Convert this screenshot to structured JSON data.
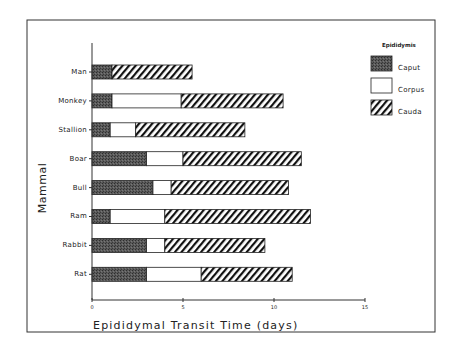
{
  "chart_data": {
    "type": "bar",
    "orientation": "horizontal",
    "stacked": true,
    "title": "",
    "xlabel": "Epididymal Transit Time (days)",
    "ylabel": "Mammal",
    "xlim": [
      0,
      15
    ],
    "xticks": [
      0,
      5,
      10,
      15
    ],
    "xtick_labels": [
      "0",
      "5",
      "10",
      "15"
    ],
    "grid": false,
    "categories": [
      "Man",
      "Monkey",
      "Stallion",
      "Boar",
      "Bull",
      "Ram",
      "Rabbit",
      "Rat"
    ],
    "series": [
      {
        "name": "Caput",
        "pattern": "dark-stipple",
        "values": [
          1.1,
          1.1,
          1.0,
          3.0,
          3.35,
          1.0,
          3.0,
          3.0
        ]
      },
      {
        "name": "Corpus",
        "pattern": "white",
        "values": [
          0,
          3.8,
          1.4,
          2.0,
          1.0,
          3.0,
          1.0,
          3.0
        ]
      },
      {
        "name": "Cauda",
        "pattern": "diagonal-hatch",
        "values": [
          4.4,
          5.6,
          6.0,
          6.5,
          6.45,
          8.0,
          5.5,
          5.0
        ]
      }
    ],
    "legend": {
      "title": "Epididymis",
      "position": "top-right",
      "entries": [
        "Caput",
        "Corpus",
        "Cauda"
      ]
    },
    "colors": {
      "caput": "#4a4a4a",
      "corpus": "#ffffff",
      "cauda_stripe": "#111111",
      "axis": "#333333"
    }
  }
}
